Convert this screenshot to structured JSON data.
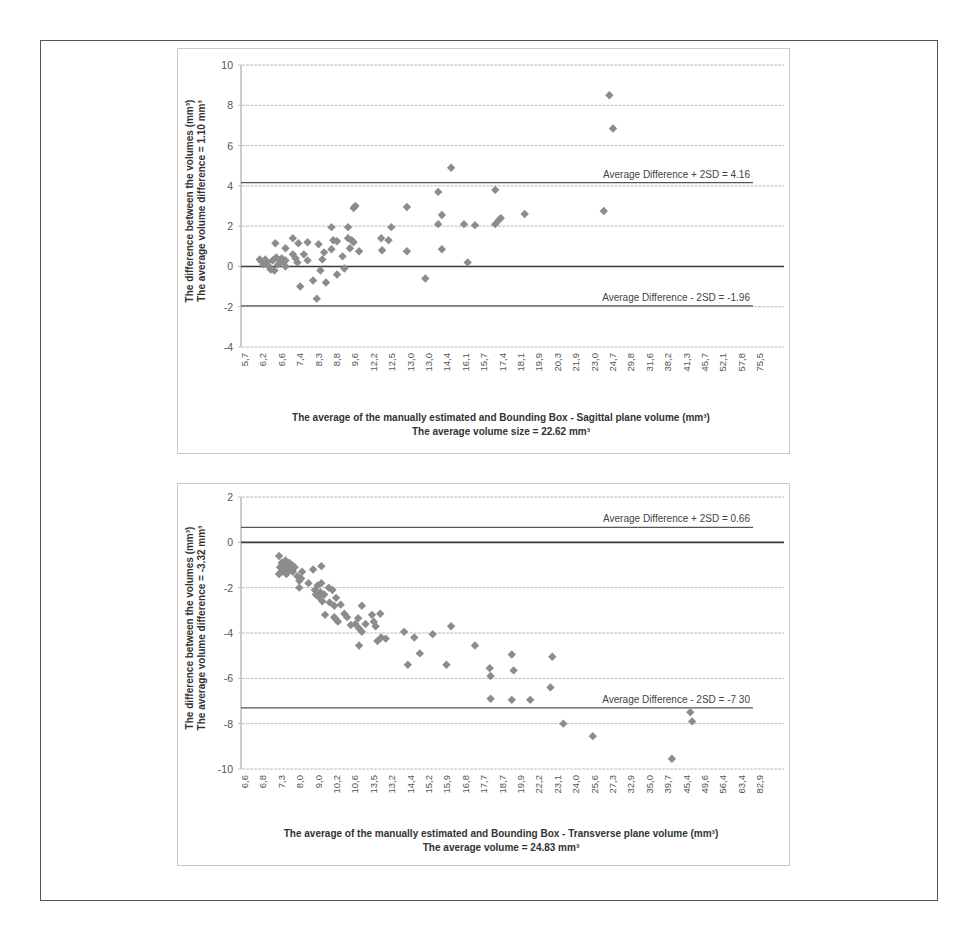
{
  "colors": {
    "point": "#8c8c8c",
    "gridline": "#bdbdbd",
    "zero_line": "#3a3a3a",
    "avg_line": "#555555",
    "axis": "#999999"
  },
  "chart_data": [
    {
      "type": "scatter",
      "title": "",
      "xlabel": "The average of the manually  estimated and Bounding Box - Sagittal plane volume (mm³)",
      "xlabel_line2": "The average volume size = 22.62 mm³",
      "ylabel": "The difference  between the volumes  (mm³)",
      "ylabel_line2": "The average  volume difference = 1.10 mm³",
      "ylim": [
        -4,
        10
      ],
      "yticks": [
        10,
        8,
        6,
        4,
        2,
        0,
        -2,
        -4
      ],
      "grid": true,
      "x_is_categorical": true,
      "categories": [
        "5,7",
        "6,2",
        "6,6",
        "7,4",
        "8,3",
        "8,8",
        "9,6",
        "12,2",
        "12,5",
        "13,0",
        "13,0",
        "14,4",
        "16,1",
        "15,7",
        "17,4",
        "18,1",
        "19,9",
        "20,3",
        "21,9",
        "23,0",
        "24,7",
        "29,8",
        "31,6",
        "38,2",
        "41,3",
        "45,7",
        "52,1",
        "57,8",
        "75,5"
      ],
      "reference_lines": [
        {
          "name": "mean",
          "value": 0,
          "label": ""
        },
        {
          "name": "upper_limit",
          "value": 4.16,
          "label": "Average Difference + 2SD = 4.16"
        },
        {
          "name": "lower_limit",
          "value": -1.96,
          "label": "Average Difference - 2SD = -1.96"
        }
      ],
      "points": [
        {
          "x": 0.8,
          "y": 0.35
        },
        {
          "x": 0.9,
          "y": 0.25
        },
        {
          "x": 1.0,
          "y": 0.1
        },
        {
          "x": 1.1,
          "y": 0.35
        },
        {
          "x": 1.2,
          "y": 0.2
        },
        {
          "x": 1.3,
          "y": 0.0
        },
        {
          "x": 1.4,
          "y": -0.15
        },
        {
          "x": 1.5,
          "y": 0.3
        },
        {
          "x": 1.6,
          "y": -0.2
        },
        {
          "x": 1.7,
          "y": 0.45
        },
        {
          "x": 1.8,
          "y": 0.1
        },
        {
          "x": 1.9,
          "y": 0.3
        },
        {
          "x": 2.0,
          "y": 0.4
        },
        {
          "x": 2.1,
          "y": 0.2
        },
        {
          "x": 2.2,
          "y": 0.3
        },
        {
          "x": 1.65,
          "y": 1.15
        },
        {
          "x": 2.2,
          "y": 0.0
        },
        {
          "x": 2.2,
          "y": 0.9
        },
        {
          "x": 2.6,
          "y": 1.4
        },
        {
          "x": 2.9,
          "y": 1.15
        },
        {
          "x": 2.6,
          "y": 0.6
        },
        {
          "x": 2.75,
          "y": 0.4
        },
        {
          "x": 2.85,
          "y": 0.2
        },
        {
          "x": 3.0,
          "y": -1.0
        },
        {
          "x": 3.4,
          "y": 1.2
        },
        {
          "x": 3.2,
          "y": 0.6
        },
        {
          "x": 3.4,
          "y": 0.3
        },
        {
          "x": 3.7,
          "y": -0.7
        },
        {
          "x": 3.9,
          "y": -1.6
        },
        {
          "x": 4.0,
          "y": 1.1
        },
        {
          "x": 4.1,
          "y": -0.2
        },
        {
          "x": 4.2,
          "y": 0.35
        },
        {
          "x": 4.4,
          "y": -0.8
        },
        {
          "x": 4.3,
          "y": 0.7
        },
        {
          "x": 4.7,
          "y": 1.95
        },
        {
          "x": 4.7,
          "y": 0.85
        },
        {
          "x": 4.8,
          "y": 1.3
        },
        {
          "x": 5.0,
          "y": 1.25
        },
        {
          "x": 5.0,
          "y": -0.4
        },
        {
          "x": 5.3,
          "y": 0.5
        },
        {
          "x": 5.4,
          "y": -0.1
        },
        {
          "x": 5.6,
          "y": 1.95
        },
        {
          "x": 5.6,
          "y": 1.4
        },
        {
          "x": 5.8,
          "y": 1.3
        },
        {
          "x": 5.9,
          "y": 1.2
        },
        {
          "x": 5.7,
          "y": 0.9
        },
        {
          "x": 5.9,
          "y": 2.9
        },
        {
          "x": 6.0,
          "y": 3.0
        },
        {
          "x": 6.2,
          "y": 0.75
        },
        {
          "x": 7.4,
          "y": 1.4
        },
        {
          "x": 7.45,
          "y": 0.8
        },
        {
          "x": 7.8,
          "y": 1.3
        },
        {
          "x": 7.95,
          "y": 1.95
        },
        {
          "x": 8.8,
          "y": 2.95
        },
        {
          "x": 8.8,
          "y": 0.75
        },
        {
          "x": 9.8,
          "y": -0.6
        },
        {
          "x": 10.5,
          "y": 3.7
        },
        {
          "x": 10.5,
          "y": 2.1
        },
        {
          "x": 10.7,
          "y": 2.55
        },
        {
          "x": 10.7,
          "y": 0.85
        },
        {
          "x": 11.2,
          "y": 4.9
        },
        {
          "x": 11.9,
          "y": 2.1
        },
        {
          "x": 12.1,
          "y": 0.2
        },
        {
          "x": 12.5,
          "y": 2.05
        },
        {
          "x": 13.6,
          "y": 3.8
        },
        {
          "x": 13.6,
          "y": 2.1
        },
        {
          "x": 13.8,
          "y": 2.3
        },
        {
          "x": 13.9,
          "y": 2.4
        },
        {
          "x": 15.2,
          "y": 2.6
        },
        {
          "x": 19.5,
          "y": 2.75
        },
        {
          "x": 19.8,
          "y": 8.5
        },
        {
          "x": 20.0,
          "y": 6.85
        }
      ]
    },
    {
      "type": "scatter",
      "title": "",
      "xlabel": "The average of the manually  estimated and Bounding Box - Transverse plane volume (mm³)",
      "xlabel_line2": "The average volume = 24.83 mm³",
      "ylabel": "The difference  between the volumes  (mm³)",
      "ylabel_line2": "The average  volume difference = -3.32 mm³",
      "ylim": [
        -10,
        2
      ],
      "yticks": [
        2,
        0,
        -2,
        -4,
        -6,
        -8,
        -10
      ],
      "grid": true,
      "x_is_categorical": true,
      "categories": [
        "6,6",
        "6,8",
        "7,3",
        "8,0",
        "9,0",
        "10,2",
        "10,6",
        "13,5",
        "13,2",
        "14,4",
        "15,2",
        "15,9",
        "16,8",
        "17,7",
        "18,7",
        "19,9",
        "22,2",
        "23,1",
        "24,0",
        "25,6",
        "27,3",
        "32,9",
        "35,0",
        "39,7",
        "45,4",
        "49,6",
        "56,4",
        "63,4",
        "82,9"
      ],
      "reference_lines": [
        {
          "name": "mean",
          "value": 0,
          "label": ""
        },
        {
          "name": "upper_limit",
          "value": 0.66,
          "label": "Average Difference + 2SD = 0.66"
        },
        {
          "name": "lower_limit",
          "value": -7.3,
          "label": "Average Difference - 2SD = -7 30"
        }
      ],
      "points": [
        {
          "x": 1.85,
          "y": -0.6
        },
        {
          "x": 1.85,
          "y": -1.4
        },
        {
          "x": 1.9,
          "y": -1.1
        },
        {
          "x": 2.0,
          "y": -0.9
        },
        {
          "x": 2.0,
          "y": -1.3
        },
        {
          "x": 2.1,
          "y": -1.0
        },
        {
          "x": 2.15,
          "y": -1.2
        },
        {
          "x": 2.2,
          "y": -0.8
        },
        {
          "x": 2.25,
          "y": -1.4
        },
        {
          "x": 2.3,
          "y": -1.1
        },
        {
          "x": 2.4,
          "y": -0.9
        },
        {
          "x": 2.45,
          "y": -1.2
        },
        {
          "x": 2.55,
          "y": -1.0
        },
        {
          "x": 2.6,
          "y": -1.3
        },
        {
          "x": 2.7,
          "y": -1.1
        },
        {
          "x": 2.85,
          "y": -1.5
        },
        {
          "x": 2.95,
          "y": -1.7
        },
        {
          "x": 2.95,
          "y": -2.0
        },
        {
          "x": 3.1,
          "y": -1.3
        },
        {
          "x": 3.05,
          "y": -1.6
        },
        {
          "x": 3.45,
          "y": -1.8
        },
        {
          "x": 3.7,
          "y": -1.2
        },
        {
          "x": 3.8,
          "y": -2.1
        },
        {
          "x": 3.85,
          "y": -2.3
        },
        {
          "x": 3.95,
          "y": -1.9
        },
        {
          "x": 4.0,
          "y": -2.4
        },
        {
          "x": 4.1,
          "y": -2.2
        },
        {
          "x": 4.15,
          "y": -1.05
        },
        {
          "x": 4.15,
          "y": -1.8
        },
        {
          "x": 4.2,
          "y": -2.6
        },
        {
          "x": 4.3,
          "y": -2.3
        },
        {
          "x": 4.35,
          "y": -3.2
        },
        {
          "x": 4.55,
          "y": -2.0
        },
        {
          "x": 4.6,
          "y": -2.65
        },
        {
          "x": 4.75,
          "y": -2.1
        },
        {
          "x": 4.85,
          "y": -2.8
        },
        {
          "x": 4.85,
          "y": -3.3
        },
        {
          "x": 4.95,
          "y": -2.45
        },
        {
          "x": 4.95,
          "y": -3.4
        },
        {
          "x": 5.05,
          "y": -3.5
        },
        {
          "x": 5.2,
          "y": -2.75
        },
        {
          "x": 5.4,
          "y": -3.15
        },
        {
          "x": 5.55,
          "y": -3.3
        },
        {
          "x": 5.75,
          "y": -3.65
        },
        {
          "x": 6.0,
          "y": -3.6
        },
        {
          "x": 6.15,
          "y": -3.35
        },
        {
          "x": 6.2,
          "y": -3.8
        },
        {
          "x": 6.2,
          "y": -4.55
        },
        {
          "x": 6.35,
          "y": -2.8
        },
        {
          "x": 6.35,
          "y": -3.95
        },
        {
          "x": 6.55,
          "y": -3.6
        },
        {
          "x": 6.9,
          "y": -3.2
        },
        {
          "x": 7.0,
          "y": -3.5
        },
        {
          "x": 7.1,
          "y": -3.7
        },
        {
          "x": 7.2,
          "y": -4.35
        },
        {
          "x": 7.35,
          "y": -3.15
        },
        {
          "x": 7.4,
          "y": -4.2
        },
        {
          "x": 7.65,
          "y": -4.25
        },
        {
          "x": 8.65,
          "y": -3.95
        },
        {
          "x": 8.85,
          "y": -5.4
        },
        {
          "x": 9.2,
          "y": -4.2
        },
        {
          "x": 9.5,
          "y": -4.9
        },
        {
          "x": 10.2,
          "y": -4.05
        },
        {
          "x": 10.95,
          "y": -5.4
        },
        {
          "x": 11.2,
          "y": -3.7
        },
        {
          "x": 12.5,
          "y": -4.55
        },
        {
          "x": 13.3,
          "y": -5.55
        },
        {
          "x": 13.35,
          "y": -5.9
        },
        {
          "x": 13.35,
          "y": -6.9
        },
        {
          "x": 14.5,
          "y": -4.95
        },
        {
          "x": 14.6,
          "y": -5.65
        },
        {
          "x": 14.5,
          "y": -6.95
        },
        {
          "x": 15.5,
          "y": -6.95
        },
        {
          "x": 16.7,
          "y": -5.05
        },
        {
          "x": 16.6,
          "y": -6.4
        },
        {
          "x": 17.3,
          "y": -8.0
        },
        {
          "x": 18.9,
          "y": -8.55
        },
        {
          "x": 23.2,
          "y": -9.55
        },
        {
          "x": 24.2,
          "y": -7.5
        },
        {
          "x": 24.3,
          "y": -7.9
        }
      ]
    }
  ]
}
